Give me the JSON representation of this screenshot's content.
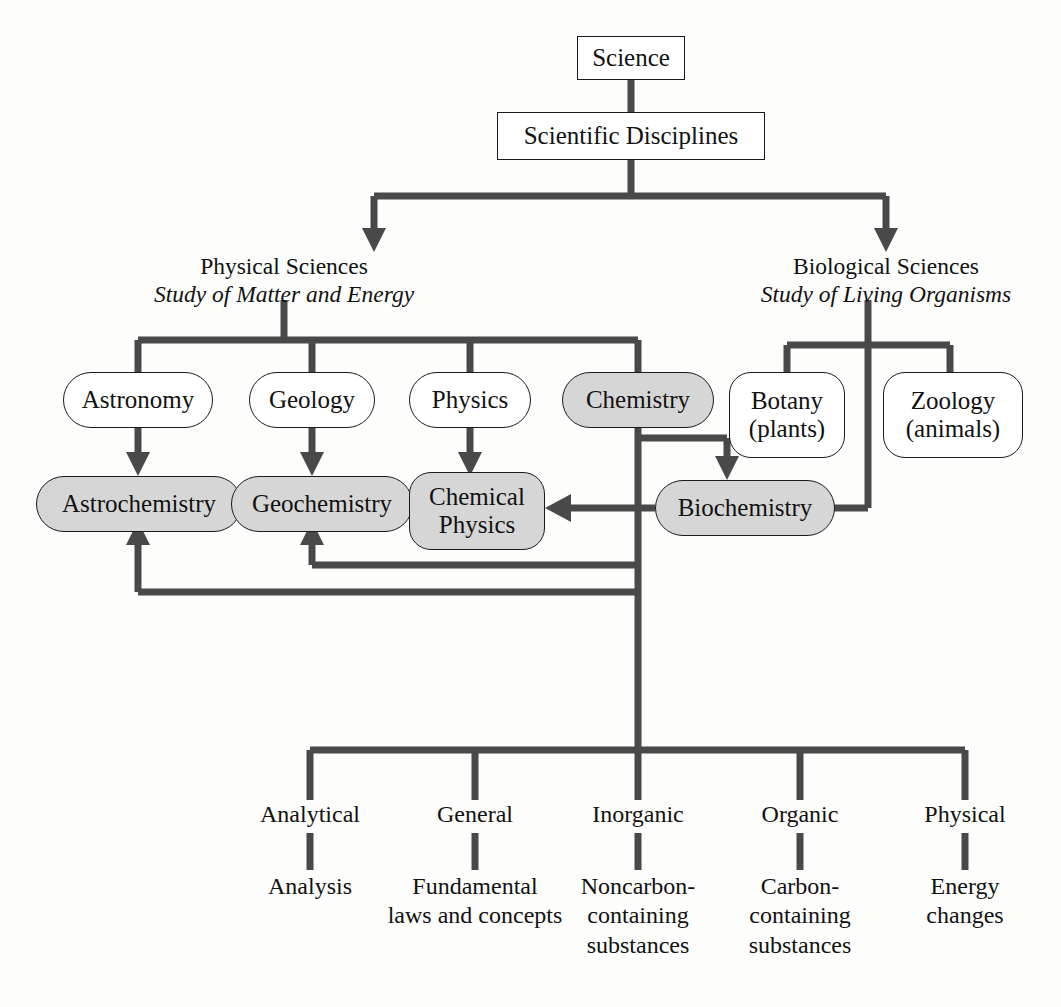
{
  "diagram": {
    "title_node": "Science",
    "subtitle_node": "Scientific Disciplines",
    "branches": [
      {
        "name": "Physical Sciences",
        "subtitle": "Study of Matter and Energy"
      },
      {
        "name": "Biological  Sciences",
        "subtitle": "Study of Living Organisms"
      }
    ],
    "physical_disciplines": [
      {
        "label": "Astronomy",
        "highlighted": "false"
      },
      {
        "label": "Geology",
        "highlighted": "false"
      },
      {
        "label": "Physics",
        "highlighted": "false"
      },
      {
        "label": "Chemistry",
        "highlighted": "true"
      }
    ],
    "biological_disciplines": [
      {
        "line1": "Botany",
        "line2": "(plants)"
      },
      {
        "line1": "Zoology",
        "line2": "(animals)"
      }
    ],
    "hybrid_fields": [
      {
        "label": "Astrochemistry",
        "highlighted": "true"
      },
      {
        "label": "Geochemistry",
        "highlighted": "true"
      },
      {
        "line1": "Chemical",
        "line2": "Physics",
        "highlighted": "true"
      },
      {
        "label": "Biochemistry",
        "highlighted": "true"
      }
    ],
    "chemistry_branches": [
      {
        "label": "Analytical",
        "desc_lines": [
          "Analysis"
        ]
      },
      {
        "label": "General",
        "desc_lines": [
          "Fundamental",
          "laws and concepts"
        ]
      },
      {
        "label": "Inorganic",
        "desc_lines": [
          "Noncarbon-",
          "containing",
          "substances"
        ]
      },
      {
        "label": "Organic",
        "desc_lines": [
          "Carbon-",
          "containing",
          "substances"
        ]
      },
      {
        "label": "Physical",
        "desc_lines": [
          "Energy",
          "changes"
        ]
      }
    ],
    "colors": {
      "line": "#494949",
      "highlight_fill": "#d6d6d6",
      "node_stroke": "#1a1a1a",
      "background": "#fdfdfb",
      "text": "#111111"
    }
  }
}
